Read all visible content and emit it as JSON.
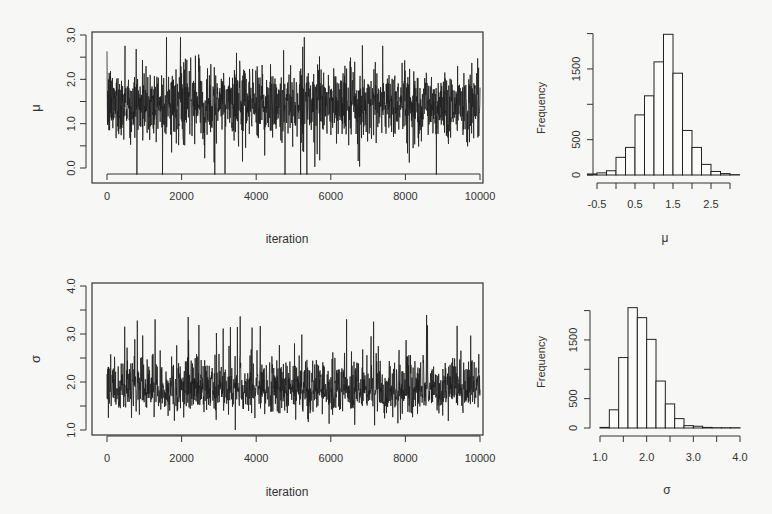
{
  "chart_data": [
    {
      "id": "mu_trace",
      "type": "line",
      "title": "",
      "xlabel": "iteration",
      "ylabel": "μ",
      "xlim": [
        0,
        10000
      ],
      "ylim": [
        0.0,
        3.0
      ],
      "x_ticks": [
        "0",
        "2000",
        "4000",
        "6000",
        "8000",
        "10000"
      ],
      "y_ticks": [
        "0.0",
        "1.0",
        "2.0",
        "3.0"
      ],
      "y_minor_ticks": [
        0.5,
        1.5,
        2.5
      ],
      "grid": false,
      "summary": {
        "n_iterations": 10000,
        "center": 1.45,
        "typical_low": 0.5,
        "typical_high": 2.5,
        "min": -0.15,
        "max": 2.95
      },
      "notes": "MCMC trace of mu; stationary noise around ~1.45"
    },
    {
      "id": "mu_hist",
      "type": "bar",
      "title": "",
      "xlabel": "μ",
      "ylabel": "Frequency",
      "x_ticks": [
        "-0.5",
        "0.5",
        "1.5",
        "2.5"
      ],
      "y_ticks": [
        "0",
        "500",
        "1500"
      ],
      "xlim": [
        -0.5,
        3.25
      ],
      "ylim": [
        0,
        2000
      ],
      "bin_width": 0.25,
      "categories": [
        "-0.50",
        "-0.25",
        "0.00",
        "0.25",
        "0.50",
        "0.75",
        "1.00",
        "1.25",
        "1.50",
        "1.75",
        "2.00",
        "2.25",
        "2.50",
        "2.75",
        "3.00"
      ],
      "bin_starts": [
        -0.25,
        0.0,
        0.25,
        0.5,
        0.75,
        1.0,
        1.25,
        1.5,
        1.75,
        2.0,
        2.25,
        2.5,
        2.75,
        3.0
      ],
      "values": [
        15,
        30,
        60,
        250,
        390,
        850,
        1120,
        1600,
        1990,
        1440,
        630,
        390,
        150,
        50,
        20,
        5
      ]
    },
    {
      "id": "sigma_trace",
      "type": "line",
      "title": "",
      "xlabel": "iteration",
      "ylabel": "σ",
      "xlim": [
        0,
        10000
      ],
      "ylim": [
        1.0,
        4.0
      ],
      "x_ticks": [
        "0",
        "2000",
        "4000",
        "6000",
        "8000",
        "10000"
      ],
      "y_ticks": [
        "1.0",
        "2.0",
        "3.0",
        "4.0"
      ],
      "y_minor_ticks": [
        1.5,
        2.5,
        3.5
      ],
      "grid": false,
      "summary": {
        "n_iterations": 10000,
        "center": 1.85,
        "typical_low": 1.4,
        "typical_high": 2.6,
        "min": 1.0,
        "max": 3.95
      },
      "notes": "MCMC trace of sigma; right-skewed with occasional spikes up to ~3.9"
    },
    {
      "id": "sigma_hist",
      "type": "bar",
      "title": "",
      "xlabel": "σ",
      "ylabel": "Frequency",
      "x_ticks": [
        "1.0",
        "2.0",
        "3.0",
        "4.0"
      ],
      "y_ticks": [
        "0",
        "500",
        "1500"
      ],
      "xlim": [
        1.0,
        4.0
      ],
      "ylim": [
        0,
        2100
      ],
      "bin_width": 0.2,
      "bin_starts": [
        1.0,
        1.2,
        1.4,
        1.6,
        1.8,
        2.0,
        2.2,
        2.4,
        2.6,
        2.8,
        3.0,
        3.2,
        3.4,
        3.6,
        3.8
      ],
      "values": [
        10,
        310,
        1200,
        2050,
        1880,
        1510,
        800,
        410,
        160,
        40,
        30,
        10,
        5,
        5,
        5
      ]
    }
  ],
  "labels": {
    "mu_symbol": "μ",
    "sigma_symbol": "σ",
    "iteration": "iteration",
    "frequency": "Frequency"
  },
  "colors": {
    "background": "#f7f7f5",
    "ink": "#1e1e1e",
    "axis": "#333333"
  }
}
